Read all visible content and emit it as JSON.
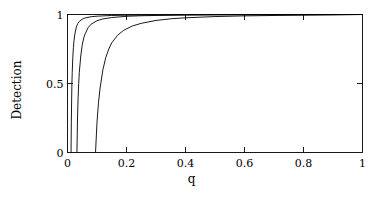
{
  "chart_data": {
    "type": "line",
    "title": "",
    "subtitle": "",
    "xlabel": "q",
    "ylabel": "Detection",
    "xlim": [
      0,
      1
    ],
    "ylim": [
      0,
      1
    ],
    "xticks": [
      0,
      0.2,
      0.4,
      0.6,
      0.8,
      1
    ],
    "xticklabels": [
      "0",
      "0.2",
      "0.4",
      "0.6",
      "0.8",
      "1"
    ],
    "yticks": [
      0,
      0.5,
      1
    ],
    "yticklabels": [
      "0",
      "0.5",
      "1"
    ],
    "grid": false,
    "legend": null,
    "legend_position": "none",
    "annotations": [],
    "axis_frame": "box",
    "tick_direction": "in",
    "line_color": "#000000",
    "background_color": "#ffffff",
    "series": [
      {
        "name": "curve-1",
        "threshold": 0.012,
        "x": [
          0.012,
          0.013,
          0.014,
          0.015,
          0.016,
          0.018,
          0.02,
          0.022,
          0.025,
          0.03,
          0.035,
          0.04,
          0.05,
          0.06,
          0.08,
          0.1,
          0.15,
          0.2,
          0.3,
          0.4,
          0.5,
          0.6,
          0.8,
          1
        ],
        "y": [
          0,
          0.22,
          0.38,
          0.5,
          0.58,
          0.69,
          0.76,
          0.81,
          0.86,
          0.91,
          0.935,
          0.95,
          0.966,
          0.975,
          0.984,
          0.988,
          0.993,
          0.995,
          0.997,
          0.998,
          0.999,
          0.999,
          1,
          1
        ]
      },
      {
        "name": "curve-2",
        "threshold": 0.032,
        "x": [
          0.032,
          0.034,
          0.036,
          0.038,
          0.04,
          0.045,
          0.05,
          0.055,
          0.06,
          0.07,
          0.08,
          0.1,
          0.12,
          0.15,
          0.2,
          0.25,
          0.3,
          0.4,
          0.5,
          0.6,
          0.8,
          1
        ],
        "y": [
          0,
          0.25,
          0.4,
          0.5,
          0.58,
          0.7,
          0.78,
          0.83,
          0.86,
          0.905,
          0.93,
          0.955,
          0.968,
          0.978,
          0.987,
          0.991,
          0.993,
          0.996,
          0.997,
          0.998,
          0.999,
          1
        ]
      },
      {
        "name": "curve-3",
        "threshold": 0.095,
        "x": [
          0.095,
          0.1,
          0.105,
          0.11,
          0.12,
          0.13,
          0.14,
          0.15,
          0.17,
          0.19,
          0.22,
          0.25,
          0.3,
          0.35,
          0.4,
          0.5,
          0.6,
          0.7,
          0.8,
          0.9,
          1
        ],
        "y": [
          0,
          0.22,
          0.36,
          0.46,
          0.6,
          0.69,
          0.75,
          0.795,
          0.85,
          0.885,
          0.917,
          0.936,
          0.957,
          0.969,
          0.976,
          0.985,
          0.99,
          0.993,
          0.995,
          0.997,
          1
        ]
      }
    ]
  },
  "figure": {
    "caption": ""
  }
}
